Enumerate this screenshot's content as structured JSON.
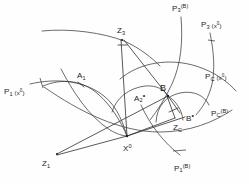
{
  "figure": {
    "type": "geometric-construction",
    "background_color": "#fefefe",
    "stroke_color": "#3a3a3a",
    "text_color": "#1c1c1c"
  },
  "labels": {
    "p1_x0": {
      "base": "P",
      "sub": "1",
      "arg": "(x",
      "arg_sup": "0",
      "arg_close": ")",
      "x": 4,
      "y": 88
    },
    "p3_B": {
      "base": "P",
      "sub": "3",
      "sup": "(B)",
      "x": 172,
      "y": 4
    },
    "p3_x0": {
      "base": "P",
      "sub": "3",
      "arg": "(x",
      "arg_sup": "0",
      "arg_close": ")",
      "x": 201,
      "y": 21
    },
    "pc_x0": {
      "base": "P",
      "sub": "C",
      "arg": "(x",
      "arg_sup": "0",
      "arg_close": ")",
      "x": 205,
      "y": 73
    },
    "pc_B": {
      "base": "P",
      "sub": "C",
      "sup": "(B)",
      "x": 211,
      "y": 109
    },
    "p1_B": {
      "base": "P",
      "sub": "1",
      "sup": "(B)",
      "x": 174,
      "y": 164
    },
    "z3": {
      "base": "Z",
      "sub": "3",
      "x": 117,
      "y": 27
    },
    "z1": {
      "base": "Z",
      "sub": "1",
      "x": 42,
      "y": 160
    },
    "zc": {
      "base": "Z",
      "sub": "C",
      "x": 173,
      "y": 124
    },
    "a1": {
      "base": "A",
      "sub": "1",
      "x": 77,
      "y": 72
    },
    "a2": {
      "base": "A",
      "sub": "2",
      "dot": "•",
      "x": 134,
      "y": 92
    },
    "b": {
      "base": "B",
      "x": 160,
      "y": 84
    },
    "b_dot": {
      "base": "B",
      "dot": "•",
      "x": 186,
      "y": 112
    },
    "x0": {
      "base": "X",
      "sup": "0",
      "x": 123,
      "y": 144
    }
  },
  "points": [
    {
      "name": "Z3",
      "x": 122,
      "y": 39
    },
    {
      "name": "Z1",
      "x": 56,
      "y": 155
    },
    {
      "name": "ZC",
      "x": 175,
      "y": 119
    },
    {
      "name": "X0",
      "x": 127,
      "y": 136
    },
    {
      "name": "B",
      "x": 167,
      "y": 96
    },
    {
      "name": "A1",
      "x": 82,
      "y": 85
    },
    {
      "name": "A2",
      "x": 143,
      "y": 88
    },
    {
      "name": "Bstar",
      "x": 181,
      "y": 114
    }
  ],
  "curves": [
    {
      "name": "P1-x0-locus"
    },
    {
      "name": "P3-x0-locus"
    },
    {
      "name": "PC-x0-locus"
    },
    {
      "name": "P3-B-locus"
    },
    {
      "name": "PC-B-locus"
    },
    {
      "name": "P1-B-locus"
    },
    {
      "name": "upper-arc"
    },
    {
      "name": "inner-arc-left"
    },
    {
      "name": "inner-arc-right"
    }
  ],
  "rays": [
    {
      "name": "Z3-to-X0"
    },
    {
      "name": "Z3-to-B"
    },
    {
      "name": "Z1-to-X0"
    },
    {
      "name": "Z1-to-A1-B"
    },
    {
      "name": "ZC-to-B"
    },
    {
      "name": "ZC-to-X0"
    }
  ]
}
